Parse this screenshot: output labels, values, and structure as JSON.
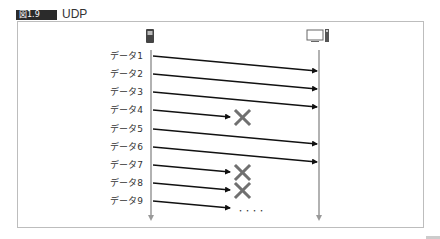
{
  "figure": {
    "number": "図1.9",
    "title": "UDP"
  },
  "nodes": {
    "sender": {
      "icon": "phone-icon",
      "x": 151
    },
    "receiver": {
      "icon": "server-icon",
      "x": 319
    }
  },
  "colors": {
    "arrow": "#111111",
    "lifeline": "#999999",
    "lost_mark": "#707070",
    "badge_bg": "#2b2b2b",
    "frame": "#bdbdbd"
  },
  "messages": [
    {
      "label": "データ1",
      "status": "delivered"
    },
    {
      "label": "データ2",
      "status": "delivered"
    },
    {
      "label": "データ3",
      "status": "delivered"
    },
    {
      "label": "データ4",
      "status": "lost"
    },
    {
      "label": "データ5",
      "status": "delivered"
    },
    {
      "label": "データ6",
      "status": "delivered"
    },
    {
      "label": "データ7",
      "status": "lost"
    },
    {
      "label": "データ8",
      "status": "lost"
    },
    {
      "label": "データ9",
      "status": "continues"
    }
  ],
  "continuation": "・・・・"
}
